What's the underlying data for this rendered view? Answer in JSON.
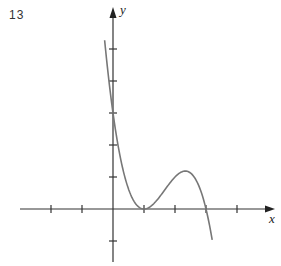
{
  "figure": {
    "number": "13"
  },
  "axes": {
    "x_label": "x",
    "y_label": "y"
  },
  "chart_data": {
    "type": "line",
    "title": "",
    "xlabel": "x",
    "ylabel": "y",
    "xlim": [
      -3,
      5
    ],
    "ylim": [
      -1.8,
      6
    ],
    "x_ticks": [
      -2,
      -1,
      1,
      2,
      3,
      4
    ],
    "y_ticks": [
      -1,
      1,
      2,
      3,
      4,
      5
    ],
    "grid": false,
    "series": [
      {
        "name": "f(x) = (x-1)^2 (3-x)",
        "x": [
          -0.27,
          0,
          0.5,
          1,
          1.5,
          2,
          2.333,
          2.7,
          3,
          3.2
        ],
        "y": [
          5.06,
          3,
          0.625,
          0,
          0.375,
          1,
          1.185,
          0.88,
          0,
          -0.97
        ]
      }
    ],
    "annotations": [
      "local minimum at (1,0)",
      "local maximum near (2.33,1.19)",
      "root at x=3"
    ]
  }
}
